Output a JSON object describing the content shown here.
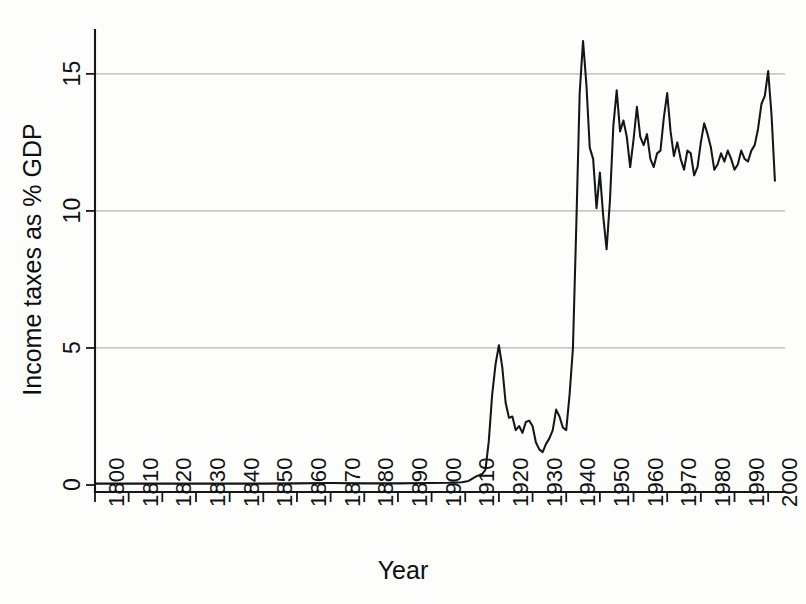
{
  "chart_data": {
    "type": "line",
    "title": "",
    "xlabel": "Year",
    "ylabel": "Income taxes as % GDP",
    "xlim": [
      1800,
      2005
    ],
    "ylim": [
      0,
      16.6
    ],
    "grid": true,
    "gridlines_y": [
      5,
      10,
      15
    ],
    "legend": "none",
    "ytick_labels": [
      "0",
      "5",
      "10",
      "15"
    ],
    "ytick_values": [
      0,
      5,
      10,
      15
    ],
    "xtick_labels": [
      "1800",
      "1810",
      "1820",
      "1830",
      "1840",
      "1850",
      "1860",
      "1870",
      "1880",
      "1890",
      "1900",
      "1910",
      "1920",
      "1930",
      "1940",
      "1950",
      "1960",
      "1970",
      "1980",
      "1990",
      "2000"
    ],
    "xtick_values": [
      1800,
      1810,
      1820,
      1830,
      1840,
      1850,
      1860,
      1870,
      1880,
      1890,
      1900,
      1910,
      1920,
      1930,
      1940,
      1950,
      1960,
      1970,
      1980,
      1990,
      2000
    ],
    "series": [
      {
        "name": "Income taxes as % GDP",
        "color": "#141518",
        "x": [
          1800,
          1810,
          1820,
          1830,
          1840,
          1850,
          1860,
          1870,
          1880,
          1890,
          1900,
          1905,
          1909,
          1911,
          1913,
          1914,
          1915,
          1916,
          1917,
          1918,
          1919,
          1920,
          1921,
          1922,
          1923,
          1924,
          1925,
          1926,
          1927,
          1928,
          1929,
          1930,
          1931,
          1932,
          1933,
          1934,
          1935,
          1936,
          1937,
          1938,
          1939,
          1940,
          1941,
          1942,
          1943,
          1944,
          1945,
          1946,
          1947,
          1948,
          1949,
          1950,
          1951,
          1952,
          1953,
          1954,
          1955,
          1956,
          1957,
          1958,
          1959,
          1960,
          1961,
          1962,
          1963,
          1964,
          1965,
          1966,
          1967,
          1968,
          1969,
          1970,
          1971,
          1972,
          1973,
          1974,
          1975,
          1976,
          1977,
          1978,
          1979,
          1980,
          1981,
          1982,
          1983,
          1984,
          1985,
          1986,
          1987,
          1988,
          1989,
          1990,
          1991,
          1992,
          1993,
          1994,
          1995,
          1996,
          1997,
          1998,
          1999,
          2000,
          2001,
          2002
        ],
        "y": [
          0.05,
          0.05,
          0.05,
          0.05,
          0.05,
          0.05,
          0.06,
          0.07,
          0.06,
          0.06,
          0.07,
          0.08,
          0.1,
          0.15,
          0.3,
          0.35,
          0.4,
          0.55,
          1.6,
          3.3,
          4.4,
          5.1,
          4.3,
          3.0,
          2.45,
          2.5,
          2.0,
          2.15,
          1.9,
          2.3,
          2.35,
          2.15,
          1.55,
          1.3,
          1.2,
          1.5,
          1.7,
          2.0,
          2.75,
          2.5,
          2.1,
          2.0,
          3.3,
          5.0,
          9.5,
          14.3,
          16.2,
          14.6,
          12.3,
          11.9,
          10.1,
          11.4,
          9.8,
          8.6,
          10.4,
          13.1,
          14.4,
          12.9,
          13.3,
          12.7,
          11.6,
          12.6,
          13.8,
          12.7,
          12.4,
          12.8,
          11.9,
          11.6,
          12.1,
          12.2,
          13.4,
          14.3,
          12.9,
          12.0,
          12.5,
          11.9,
          11.5,
          12.2,
          12.1,
          11.3,
          11.6,
          12.5,
          13.2,
          12.8,
          12.3,
          11.5,
          11.7,
          12.1,
          11.8,
          12.2,
          11.9,
          11.5,
          11.7,
          12.2,
          11.9,
          11.8,
          12.2,
          12.4,
          13.0,
          13.9,
          14.2,
          15.1,
          13.5,
          11.1
        ]
      }
    ]
  },
  "axes": {
    "ylabel_text": "Income taxes as % GDP",
    "xlabel_text": "Year"
  }
}
